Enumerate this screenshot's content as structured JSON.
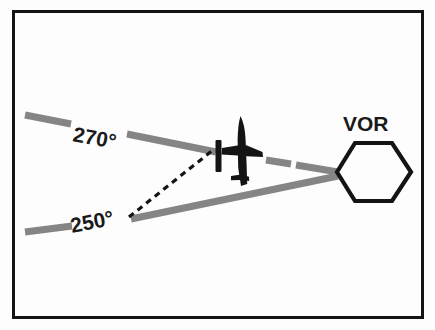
{
  "figure": {
    "name": "VOR course deviation diagram",
    "background_color": "#fdfdfd",
    "border_color": "#141414",
    "radial_color": "#858585",
    "ink_color": "#141414"
  },
  "labels": {
    "radial_270": "270°",
    "radial_250": "250°",
    "station": "VOR"
  },
  "diagram_data": {
    "type": "diagram",
    "station": {
      "label": "VOR",
      "symbol": "hexagon",
      "center_x": 374,
      "center_y": 168,
      "radius": 38
    },
    "radials": [
      {
        "label": "270°",
        "bearing_degrees": 270,
        "from_x": 25,
        "from_y": 115,
        "to_x": 336,
        "to_y": 172,
        "color": "#858585",
        "style": "solid"
      },
      {
        "label": "250°",
        "bearing_degrees": 250,
        "from_x": 25,
        "from_y": 232,
        "to_x": 336,
        "to_y": 174,
        "color": "#858585",
        "style": "solid"
      }
    ],
    "aircraft": {
      "symbol": "airplane-top-view",
      "heading": "north",
      "x": 243,
      "y": 152
    },
    "course_deviation_bar": {
      "symbol": "cdi-needle",
      "x": 218,
      "y_top": 141,
      "y_bottom": 171
    },
    "connector": {
      "style": "dashed",
      "from_x": 128,
      "from_y": 218,
      "to_x": 212,
      "to_y": 150,
      "color": "#141414"
    }
  }
}
